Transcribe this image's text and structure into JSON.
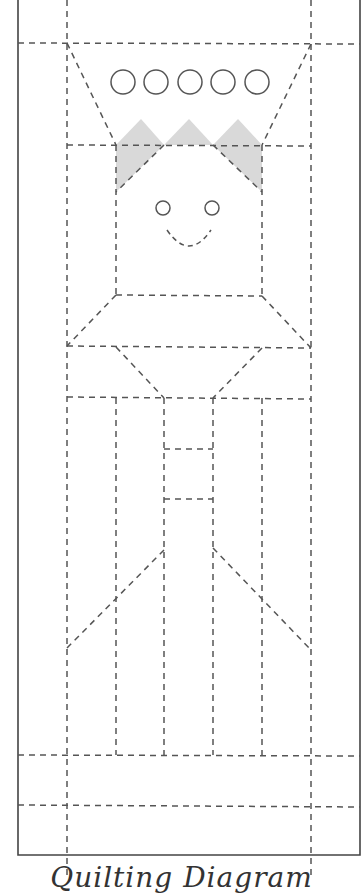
{
  "caption": "Quilting Diagram",
  "colors": {
    "line": "#555555",
    "border": "#444444",
    "shade": "#d9d9d9",
    "background": "#ffffff"
  },
  "hat": {
    "circle_count": 5
  },
  "face": {
    "eyes": 2,
    "smile": true
  }
}
